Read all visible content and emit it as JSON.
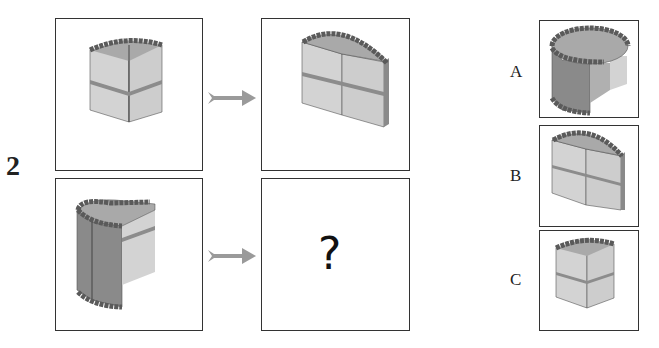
{
  "problem": {
    "number": "2"
  },
  "grid": {
    "top_left": {
      "figure": "cake-slice-quarter"
    },
    "top_right": {
      "figure": "cake-half"
    },
    "bottom_left": {
      "figure": "cake-three-quarter"
    },
    "bottom_right": {
      "figure": "unknown",
      "text": "?"
    }
  },
  "arrows": [
    {
      "icon": "arrow-right-icon"
    },
    {
      "icon": "arrow-right-icon"
    }
  ],
  "options": [
    {
      "label": "A",
      "figure": "cake-three-quarter-large"
    },
    {
      "label": "B",
      "figure": "cake-half"
    },
    {
      "label": "C",
      "figure": "cake-slice-quarter"
    }
  ],
  "colors": {
    "side_light": "#d3d3d3",
    "side_dark": "#8a8a8a",
    "top": "#a9a9a9",
    "band": "#8c8c8c",
    "bead": "#5a5a5a",
    "arrow": "#9a9a9a"
  }
}
